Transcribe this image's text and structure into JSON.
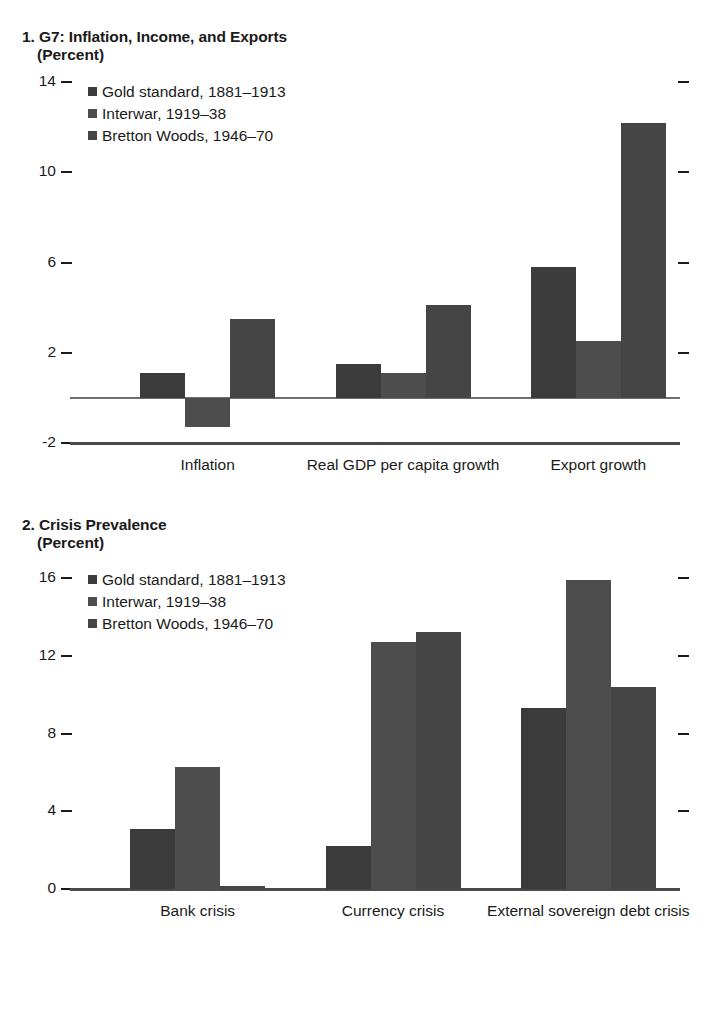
{
  "figure": {
    "series_colors": [
      "#3b3b3b",
      "#4d4d4d",
      "#454545"
    ],
    "axis_color": "#1a1a1a"
  },
  "panel1": {
    "title": "1. G7: Inflation, Income, and Exports",
    "subtitle": "(Percent)",
    "legend": [
      "Gold standard, 1881–1913",
      "Interwar, 1919–38",
      "Bretton Woods, 1946–70"
    ],
    "y_ticks": [
      "14",
      "10",
      "6",
      "2",
      "-2"
    ],
    "categories": [
      "Inflation",
      "Real GDP per capita growth",
      "Export growth"
    ]
  },
  "panel2": {
    "title": "2. Crisis Prevalence",
    "subtitle": "(Percent)",
    "legend": [
      "Gold standard, 1881–1913",
      "Interwar, 1919–38",
      "Bretton Woods, 1946–70"
    ],
    "y_ticks": [
      "16",
      "12",
      "8",
      "4",
      "0"
    ],
    "categories": [
      "Bank crisis",
      "Currency crisis",
      "External sovereign debt crisis"
    ]
  },
  "chart_data": [
    {
      "type": "bar",
      "title": "1. G7: Inflation, Income, and Exports",
      "subtitle": "(Percent)",
      "xlabel": "",
      "ylabel": "Percent",
      "ylim": [
        -2,
        14
      ],
      "yticks": [
        -2,
        2,
        6,
        10,
        14
      ],
      "grid": false,
      "legend_position": "top-left",
      "categories": [
        "Inflation",
        "Real GDP per capita growth",
        "Export growth"
      ],
      "series": [
        {
          "name": "Gold standard, 1881–1913",
          "values": [
            1.1,
            1.5,
            5.8
          ]
        },
        {
          "name": "Interwar, 1919–38",
          "values": [
            -1.3,
            1.1,
            2.5
          ]
        },
        {
          "name": "Bretton Woods, 1946–70",
          "values": [
            3.5,
            4.1,
            12.2
          ]
        }
      ]
    },
    {
      "type": "bar",
      "title": "2. Crisis Prevalence",
      "subtitle": "(Percent)",
      "xlabel": "",
      "ylabel": "Percent",
      "ylim": [
        0,
        16
      ],
      "yticks": [
        0,
        4,
        8,
        12,
        16
      ],
      "grid": false,
      "legend_position": "top-left",
      "categories": [
        "Bank crisis",
        "Currency crisis",
        "External sovereign debt crisis"
      ],
      "series": [
        {
          "name": "Gold standard, 1881–1913",
          "values": [
            3.1,
            2.2,
            9.3
          ]
        },
        {
          "name": "Interwar, 1919–38",
          "values": [
            6.3,
            12.7,
            15.9
          ]
        },
        {
          "name": "Bretton Woods, 1946–70",
          "values": [
            0.15,
            13.2,
            10.4
          ]
        }
      ]
    }
  ]
}
